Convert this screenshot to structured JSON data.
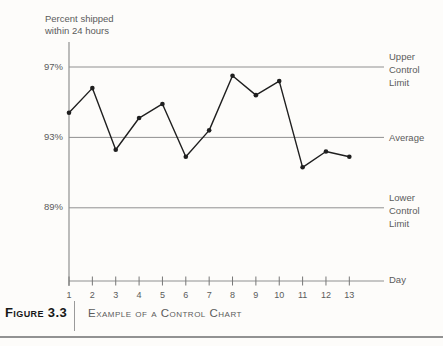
{
  "chart_data": {
    "type": "line",
    "title": "Example of a Control Chart",
    "xlabel": "Day",
    "ylabel_lines": [
      "Percent shipped",
      "within 24 hours"
    ],
    "x": [
      1,
      2,
      3,
      4,
      5,
      6,
      7,
      8,
      9,
      10,
      11,
      12,
      13
    ],
    "series": [
      {
        "name": "Percent shipped within 24 hours",
        "values": [
          94.4,
          95.8,
          92.3,
          94.1,
          94.9,
          91.9,
          93.4,
          96.5,
          95.4,
          96.2,
          91.3,
          92.2,
          91.9
        ]
      }
    ],
    "ucl": {
      "value": 97,
      "tick_label": "97%",
      "label_lines": [
        "Upper",
        "Control",
        "Limit"
      ]
    },
    "average": {
      "value": 93,
      "tick_label": "93%",
      "label_lines": [
        "Average"
      ]
    },
    "lcl": {
      "value": 89,
      "tick_label": "89%",
      "label_lines": [
        "Lower",
        "Control",
        "Limit"
      ]
    },
    "ylim": [
      85,
      98.5
    ],
    "grid": "off",
    "legend": "none",
    "line_color": "#1f1f1f",
    "reference_line_color": "#909090"
  },
  "caption": {
    "label": "Figure 3.3",
    "title": "Example of a Control Chart"
  }
}
